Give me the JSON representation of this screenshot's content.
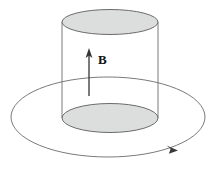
{
  "figure": {
    "name": "magnetic-field-through-cylinder",
    "caption": "",
    "background_color": "#ffffff",
    "labels": {
      "field_label": "B"
    },
    "colors": {
      "stroke": "#6b6b6b",
      "stroke_dark": "#4a4a4a",
      "cap_fill": "#dcdedd",
      "arrow": "#222222",
      "label_text": "#111111",
      "background": "#ffffff"
    },
    "elements": {
      "cylinder": {
        "name": "cylinder",
        "left_x": 62,
        "right_x": 158,
        "top_center_y": 22,
        "bottom_center_y": 118,
        "radius_x": 48,
        "radius_y": 12.5,
        "bottom_radius_y": 14.5
      },
      "top_cap": {
        "name": "cylinder-top-cap",
        "cx": 110,
        "cy": 22,
        "rx": 48,
        "ry": 12.5
      },
      "bottom_cap": {
        "name": "cylinder-bottom-cap",
        "cx": 110,
        "cy": 118,
        "rx": 48,
        "ry": 14.5
      },
      "field_arrow": {
        "name": "magnetic-field-arrow",
        "x": 89,
        "tail_y": 96,
        "head_y": 50,
        "direction": "up"
      },
      "current_loop": {
        "name": "current-loop",
        "cx": 108,
        "cy": 117,
        "rx": 97,
        "ry": 40,
        "direction": "clockwise",
        "arrowhead_x": 172,
        "arrowhead_y": 148
      }
    }
  }
}
